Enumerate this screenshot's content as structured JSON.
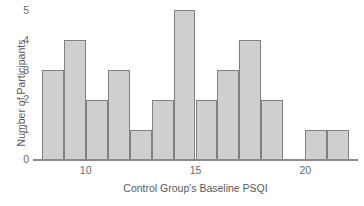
{
  "chart_data": {
    "type": "bar",
    "title": "",
    "xlabel": "Control Group's Baseline PSQI",
    "ylabel": "Number of Participants",
    "grid": false,
    "legend": null,
    "xlim": [
      7.6,
      22.4
    ],
    "ylim": [
      0,
      5
    ],
    "bin_width": 1,
    "xticks": [
      10,
      15,
      20
    ],
    "xtick_labels": [
      "10",
      "15",
      "20"
    ],
    "yticks": [
      0,
      1,
      2,
      3,
      4,
      5
    ],
    "ytick_labels": [
      "0",
      "1",
      "2",
      "3",
      "4",
      "5"
    ],
    "bin_edges": [
      8,
      9,
      10,
      11,
      12,
      13,
      14,
      15,
      16,
      17,
      18,
      19,
      20,
      21,
      22
    ],
    "categories": [
      "8-9",
      "9-10",
      "10-11",
      "11-12",
      "12-13",
      "13-14",
      "14-15",
      "15-16",
      "16-17",
      "17-18",
      "18-19",
      "19-20",
      "20-21",
      "21-22"
    ],
    "values": [
      3,
      4,
      2,
      3,
      1,
      2,
      5,
      2,
      3,
      4,
      2,
      0,
      1,
      1
    ],
    "bar_fill_color": "#cfcfcf",
    "bar_edge_color": "#808080",
    "axis_color": "#8a8a8a",
    "text_color": "#5a5a5a"
  }
}
